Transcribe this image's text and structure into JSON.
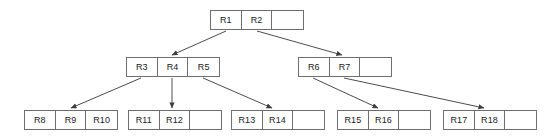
{
  "diagram": {
    "type": "b-tree",
    "colors": {
      "node_border": "#6e6e6e",
      "node_fill": "#ffffff",
      "edge": "#4d4d4d",
      "text": "#1a1a1a",
      "background": "#ffffff"
    },
    "nodes": [
      {
        "id": "root",
        "level": 0,
        "x": 210,
        "y": 10,
        "cells": [
          "R1",
          "R2",
          ""
        ]
      },
      {
        "id": "internal-left",
        "level": 1,
        "x": 126,
        "y": 57,
        "cells": [
          "R3",
          "R4",
          "R5"
        ]
      },
      {
        "id": "internal-right",
        "level": 1,
        "x": 298,
        "y": 57,
        "cells": [
          "R6",
          "R7",
          ""
        ]
      },
      {
        "id": "leaf-1",
        "level": 2,
        "x": 24,
        "y": 110,
        "cells": [
          "R8",
          "R9",
          "R10"
        ]
      },
      {
        "id": "leaf-2",
        "level": 2,
        "x": 128,
        "y": 110,
        "cells": [
          "R11",
          "R12",
          ""
        ]
      },
      {
        "id": "leaf-3",
        "level": 2,
        "x": 231,
        "y": 110,
        "cells": [
          "R13",
          "R14",
          ""
        ]
      },
      {
        "id": "leaf-4",
        "level": 2,
        "x": 337,
        "y": 110,
        "cells": [
          "R15",
          "R16",
          ""
        ]
      },
      {
        "id": "leaf-5",
        "level": 2,
        "x": 443,
        "y": 110,
        "cells": [
          "R17",
          "R18",
          ""
        ]
      }
    ],
    "edges": [
      {
        "id": "edge-root-to-internal-left",
        "from": "root",
        "to": "internal-left",
        "x1": 226,
        "y1": 31,
        "x2": 172,
        "y2": 55
      },
      {
        "id": "edge-root-to-internal-right",
        "from": "root",
        "to": "internal-right",
        "x1": 257,
        "y1": 31,
        "x2": 342,
        "y2": 55
      },
      {
        "id": "edge-left-to-leaf-1",
        "from": "internal-left",
        "to": "leaf-1",
        "x1": 141,
        "y1": 78,
        "x2": 71,
        "y2": 108
      },
      {
        "id": "edge-left-to-leaf-2",
        "from": "internal-left",
        "to": "leaf-2",
        "x1": 172,
        "y1": 78,
        "x2": 172,
        "y2": 108
      },
      {
        "id": "edge-left-to-leaf-3",
        "from": "internal-left",
        "to": "leaf-3",
        "x1": 203,
        "y1": 78,
        "x2": 272,
        "y2": 108
      },
      {
        "id": "edge-right-to-leaf-4",
        "from": "internal-right",
        "to": "leaf-4",
        "x1": 313,
        "y1": 78,
        "x2": 378,
        "y2": 108
      },
      {
        "id": "edge-right-to-leaf-5",
        "from": "internal-right",
        "to": "leaf-5",
        "x1": 344,
        "y1": 78,
        "x2": 484,
        "y2": 108
      }
    ]
  }
}
